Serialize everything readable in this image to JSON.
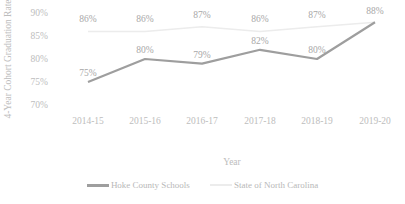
{
  "chart_data": {
    "type": "line",
    "title": "",
    "xlabel": "Year",
    "ylabel": "4-Year Cohort Graduation Rate",
    "categories": [
      "2014-15",
      "2015-16",
      "2016-17",
      "2017-18",
      "2018-19",
      "2019-20"
    ],
    "yticks": [
      "70%",
      "75%",
      "80%",
      "85%",
      "90%"
    ],
    "ylim": [
      70,
      90
    ],
    "grid": false,
    "legend_position": "bottom",
    "series": [
      {
        "name": "Hoke County Schools",
        "color": "#9e9e9e",
        "values": [
          75,
          80,
          79,
          82,
          80,
          88
        ],
        "labels": [
          "75%",
          "80%",
          "79%",
          "82%",
          "80%",
          "88%"
        ]
      },
      {
        "name": "State of North Carolina",
        "color": "#ececec",
        "values": [
          86,
          86,
          87,
          86,
          87,
          88
        ],
        "labels": [
          "86%",
          "86%",
          "87%",
          "86%",
          "87%",
          "88%"
        ]
      }
    ]
  },
  "legend": {
    "hoke": "Hoke County Schools",
    "state": "State of North Carolina"
  }
}
